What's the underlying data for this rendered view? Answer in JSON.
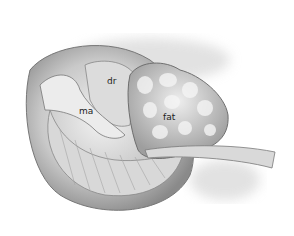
{
  "illustration": {
    "subject": "anatomical-illustration",
    "labels": [
      {
        "id": "dr",
        "text": "dr"
      },
      {
        "id": "ma",
        "text": "ma"
      },
      {
        "id": "fat",
        "text": "fat"
      }
    ]
  },
  "colors": {
    "background": "#ffffff",
    "tissue_light": "#e6e6e6",
    "tissue_mid": "#bdbdbd",
    "tissue_dark": "#7a7a7a",
    "label": "#222222"
  }
}
